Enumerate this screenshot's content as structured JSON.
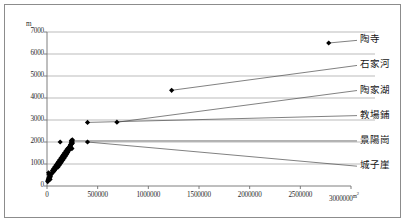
{
  "figure": {
    "type": "scatter-with-annotations",
    "background": "#ffffff",
    "frame_color": "#8c8c8c"
  },
  "chart_data": {
    "type": "scatter",
    "title": "",
    "xlabel": "",
    "ylabel": "m",
    "x_unit": "m2",
    "xlim": [
      0,
      3000000
    ],
    "ylim": [
      0,
      7000
    ],
    "grid": true,
    "grid_axis": "y",
    "legend_position": "right-inline-annotations",
    "xticks": [
      0,
      500000,
      1000000,
      1500000,
      2000000,
      2500000,
      3000000
    ],
    "xtick_labels": [
      "0",
      "500000",
      "1000000",
      "1500000",
      "2000000",
      "2500000",
      "3000000"
    ],
    "yticks": [
      0,
      1000,
      2000,
      3000,
      4000,
      5000,
      6000,
      7000
    ],
    "ytick_labels": [
      "0",
      "1000",
      "2000",
      "3000",
      "4000",
      "5000",
      "6000",
      "7000"
    ],
    "marker": "diamond",
    "marker_color": "#000000",
    "annotations": [
      {
        "label": "陶寺",
        "x": 2780000,
        "y": 6500,
        "label_x": 3120000,
        "label_y": 6620
      },
      {
        "label": "石家河",
        "x": 1230000,
        "y": 4350,
        "label_x": 3120000,
        "label_y": 5480
      },
      {
        "label": "陶家湖",
        "x": 690000,
        "y": 2900,
        "label_x": 3120000,
        "label_y": 4340
      },
      {
        "label": "教場鋪",
        "x": 400000,
        "y": 2890,
        "label_x": 3120000,
        "label_y": 3200
      },
      {
        "label": "景陽崗",
        "x": 250000,
        "y": 2050,
        "label_x": 3120000,
        "label_y": 2050
      },
      {
        "label": "城子崖",
        "x": 400000,
        "y": 2000,
        "label_x": 3120000,
        "label_y": 900
      }
    ],
    "points": [
      {
        "x": 2780000,
        "y": 6500
      },
      {
        "x": 1230000,
        "y": 4350
      },
      {
        "x": 690000,
        "y": 2900
      },
      {
        "x": 400000,
        "y": 2890
      },
      {
        "x": 400000,
        "y": 2000
      },
      {
        "x": 250000,
        "y": 2050
      },
      {
        "x": 130000,
        "y": 2000
      },
      {
        "x": 240000,
        "y": 2060
      },
      {
        "x": 238000,
        "y": 1960
      },
      {
        "x": 232000,
        "y": 1880
      },
      {
        "x": 228000,
        "y": 1810
      },
      {
        "x": 236000,
        "y": 1760
      },
      {
        "x": 222000,
        "y": 1740
      },
      {
        "x": 246000,
        "y": 1700
      },
      {
        "x": 214000,
        "y": 1690
      },
      {
        "x": 208000,
        "y": 1660
      },
      {
        "x": 218000,
        "y": 1620
      },
      {
        "x": 200000,
        "y": 1600
      },
      {
        "x": 196000,
        "y": 1560
      },
      {
        "x": 204000,
        "y": 1520
      },
      {
        "x": 188000,
        "y": 1500
      },
      {
        "x": 182000,
        "y": 1460
      },
      {
        "x": 192000,
        "y": 1430
      },
      {
        "x": 176000,
        "y": 1400
      },
      {
        "x": 170000,
        "y": 1370
      },
      {
        "x": 180000,
        "y": 1340
      },
      {
        "x": 164000,
        "y": 1320
      },
      {
        "x": 158000,
        "y": 1290
      },
      {
        "x": 168000,
        "y": 1260
      },
      {
        "x": 152000,
        "y": 1240
      },
      {
        "x": 146000,
        "y": 1210
      },
      {
        "x": 156000,
        "y": 1180
      },
      {
        "x": 140000,
        "y": 1160
      },
      {
        "x": 134000,
        "y": 1130
      },
      {
        "x": 144000,
        "y": 1100
      },
      {
        "x": 128000,
        "y": 1080
      },
      {
        "x": 122000,
        "y": 1050
      },
      {
        "x": 132000,
        "y": 1020
      },
      {
        "x": 116000,
        "y": 1000
      },
      {
        "x": 110000,
        "y": 970
      },
      {
        "x": 120000,
        "y": 940
      },
      {
        "x": 104000,
        "y": 920
      },
      {
        "x": 98000,
        "y": 890
      },
      {
        "x": 108000,
        "y": 860
      },
      {
        "x": 92000,
        "y": 840
      },
      {
        "x": 86000,
        "y": 800
      },
      {
        "x": 80000,
        "y": 760
      },
      {
        "x": 74000,
        "y": 720
      },
      {
        "x": 68000,
        "y": 680
      },
      {
        "x": 60000,
        "y": 640
      },
      {
        "x": 52000,
        "y": 600
      },
      {
        "x": 44000,
        "y": 560
      },
      {
        "x": 36000,
        "y": 520
      },
      {
        "x": 30000,
        "y": 480
      },
      {
        "x": 26000,
        "y": 440
      },
      {
        "x": 22000,
        "y": 400
      },
      {
        "x": 18000,
        "y": 360
      },
      {
        "x": 15000,
        "y": 320
      },
      {
        "x": 12000,
        "y": 280
      },
      {
        "x": 9000,
        "y": 240
      },
      {
        "x": 7000,
        "y": 200
      },
      {
        "x": 26000,
        "y": 360
      },
      {
        "x": 30000,
        "y": 300
      },
      {
        "x": 20000,
        "y": 520
      },
      {
        "x": 34000,
        "y": 420
      },
      {
        "x": 16000,
        "y": 600
      },
      {
        "x": 40000,
        "y": 560
      },
      {
        "x": 250000,
        "y": 2100
      },
      {
        "x": 244000,
        "y": 2020
      },
      {
        "x": 252000,
        "y": 1950
      },
      {
        "x": 242000,
        "y": 1900
      },
      {
        "x": 230000,
        "y": 1850
      },
      {
        "x": 226000,
        "y": 1790
      },
      {
        "x": 210000,
        "y": 1730
      },
      {
        "x": 198000,
        "y": 1670
      },
      {
        "x": 186000,
        "y": 1590
      },
      {
        "x": 174000,
        "y": 1510
      },
      {
        "x": 162000,
        "y": 1430
      },
      {
        "x": 150000,
        "y": 1350
      },
      {
        "x": 138000,
        "y": 1270
      },
      {
        "x": 126000,
        "y": 1190
      },
      {
        "x": 114000,
        "y": 1110
      },
      {
        "x": 102000,
        "y": 1030
      },
      {
        "x": 90000,
        "y": 950
      },
      {
        "x": 78000,
        "y": 870
      },
      {
        "x": 66000,
        "y": 790
      },
      {
        "x": 54000,
        "y": 710
      }
    ]
  }
}
